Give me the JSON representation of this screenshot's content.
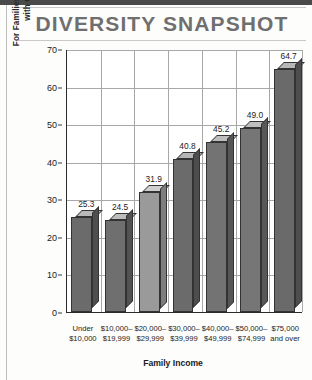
{
  "page": {
    "title": "DIVERSITY SNAPSHOT"
  },
  "chart_data": {
    "type": "bar",
    "title": "DIVERSITY SNAPSHOT",
    "xlabel": "Family Income",
    "ylabel": "For Families with Children 18 to 24 Years Old, Percentage with One or More Children Attending College",
    "ylabel_line1": "For Families with Children 18 to 24 Years Old, Percentage",
    "ylabel_line2": "with One or More Children Attending College",
    "ylim": [
      0,
      70
    ],
    "ytick_step": 10,
    "yticks": [
      0,
      10,
      20,
      30,
      40,
      50,
      60,
      70
    ],
    "grid": true,
    "legend": "none",
    "categories": [
      "Under $10,000",
      "$10,000–$19,999",
      "$20,000–$29,999",
      "$30,000–$39,999",
      "$40,000–$49,999",
      "$50,000–$74,999",
      "$75,000 and over"
    ],
    "category_lines": [
      [
        "Under",
        "$10,000"
      ],
      [
        "$10,000–",
        "$19,999"
      ],
      [
        "$20,000–",
        "$29,999"
      ],
      [
        "$30,000–",
        "$39,999"
      ],
      [
        "$40,000–",
        "$49,999"
      ],
      [
        "$50,000–",
        "$74,999"
      ],
      [
        "$75,000",
        "and over"
      ]
    ],
    "values": [
      25.3,
      24.5,
      31.9,
      40.8,
      45.2,
      49.0,
      64.7
    ],
    "value_labels": [
      "25.3",
      "24.5",
      "31.9",
      "40.8",
      "45.2",
      "49.0",
      "64.7"
    ],
    "bar_colors": [
      "#6b6b6b",
      "#6f6f6f",
      "#9a9a9a",
      "#6b6b6b",
      "#737373",
      "#767676",
      "#6a6a6a"
    ],
    "bar_top_colors": [
      "#b9b9b9",
      "#bcbcbc",
      "#cfcfcf",
      "#b5b5b5",
      "#bdbdbd",
      "#bfbfbf",
      "#b7b7b7"
    ],
    "bar_side_colors": [
      "#4f4f4f",
      "#525252",
      "#7e7e7e",
      "#4d4d4d",
      "#565656",
      "#585858",
      "#4e4e4e"
    ],
    "style": "3d-column"
  },
  "colors": {
    "title_text": "#6f6f6f",
    "axis": "#2a2a2a",
    "gridline": "#a8a8a8",
    "top_bar": "#4a4a4a",
    "rule": "#c9c9c9"
  }
}
